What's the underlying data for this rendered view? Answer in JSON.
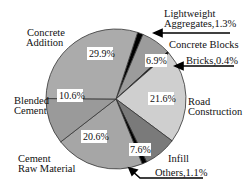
{
  "chart_data": {
    "type": "pie",
    "title": "",
    "start_angle_deg": 18,
    "direction": "clockwise",
    "slices": [
      {
        "label": "Lightweight Aggregates",
        "value": 1.3,
        "color": "#000000",
        "pct_label": "",
        "callout": "Lightweight Aggregates,1.3%"
      },
      {
        "label": "Concrete Blocks",
        "value": 6.9,
        "color": "#9c9c9c",
        "pct_label": "6.9%"
      },
      {
        "label": "Bricks",
        "value": 0.4,
        "color": "#000000",
        "pct_label": "",
        "callout": "Bricks,0.4%"
      },
      {
        "label": "Road Construction",
        "value": 21.6,
        "color": "#cfcfcf",
        "pct_label": "21.6%"
      },
      {
        "label": "Infill",
        "value": 7.6,
        "color": "#7a7a7a",
        "pct_label": "7.6%"
      },
      {
        "label": "Others",
        "value": 1.1,
        "color": "#000000",
        "pct_label": "",
        "callout": "Others,1.1%"
      },
      {
        "label": "Cement Raw Material",
        "value": 20.6,
        "color": "#a6a6a6",
        "pct_label": "20.6%"
      },
      {
        "label": "Blended Cement",
        "value": 10.6,
        "color": "#9a9a9a",
        "pct_label": "10.6%"
      },
      {
        "label": "Concrete Addition",
        "value": 29.9,
        "color": "#ababab",
        "pct_label": "29.9%"
      }
    ]
  },
  "labels": {
    "concrete_addition_1": "Concrete",
    "concrete_addition_2": "Addition",
    "lightweight_1": "Lightweight",
    "lightweight_2": "Aggregates,1.3%",
    "concrete_blocks": "Concrete Blocks",
    "bricks": "Bricks,0.4%",
    "road_1": "Road",
    "road_2": "Construction",
    "blended_1": "Blended",
    "blended_2": "Cement",
    "raw_1": "Cement",
    "raw_2": "Raw Material",
    "infill": "Infill",
    "others": "Others,1.1%"
  },
  "pct": {
    "concrete_addition": "29.9%",
    "concrete_blocks": "6.9%",
    "road": "21.6%",
    "blended": "10.6%",
    "raw": "20.6%",
    "infill": "7.6%"
  }
}
